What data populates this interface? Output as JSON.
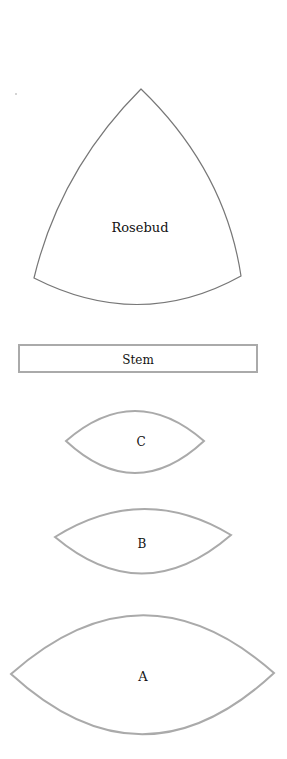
{
  "colors": {
    "background": "#ffffff",
    "rosebud_stroke": "#777777",
    "piece_stroke": "#aaaaaa",
    "text": "#111111"
  },
  "pieces": {
    "rosebud": {
      "label": "Rosebud"
    },
    "stem": {
      "label": "Stem"
    },
    "c": {
      "label": "C"
    },
    "b": {
      "label": "B"
    },
    "a": {
      "label": "A"
    }
  }
}
